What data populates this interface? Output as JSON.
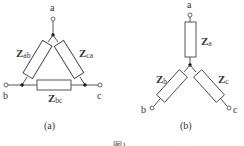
{
  "figure": {
    "caption": "图1",
    "panels": [
      {
        "id": "a",
        "label": "(a)",
        "type": "delta",
        "terminals": {
          "a": "a",
          "b": "b",
          "c": "c"
        },
        "impedances": [
          {
            "name": "Z",
            "sub": "ab"
          },
          {
            "name": "Z",
            "sub": "ca"
          },
          {
            "name": "Z",
            "sub": "bc"
          }
        ]
      },
      {
        "id": "b",
        "label": "(b)",
        "type": "star",
        "terminals": {
          "a": "a",
          "b": "b",
          "c": "c"
        },
        "impedances": [
          {
            "name": "Z",
            "sub": "a"
          },
          {
            "name": "Z",
            "sub": "b"
          },
          {
            "name": "Z",
            "sub": "c"
          }
        ]
      }
    ]
  },
  "colors": {
    "line": "#444444",
    "text": "#333333",
    "background": "#ffffff"
  }
}
